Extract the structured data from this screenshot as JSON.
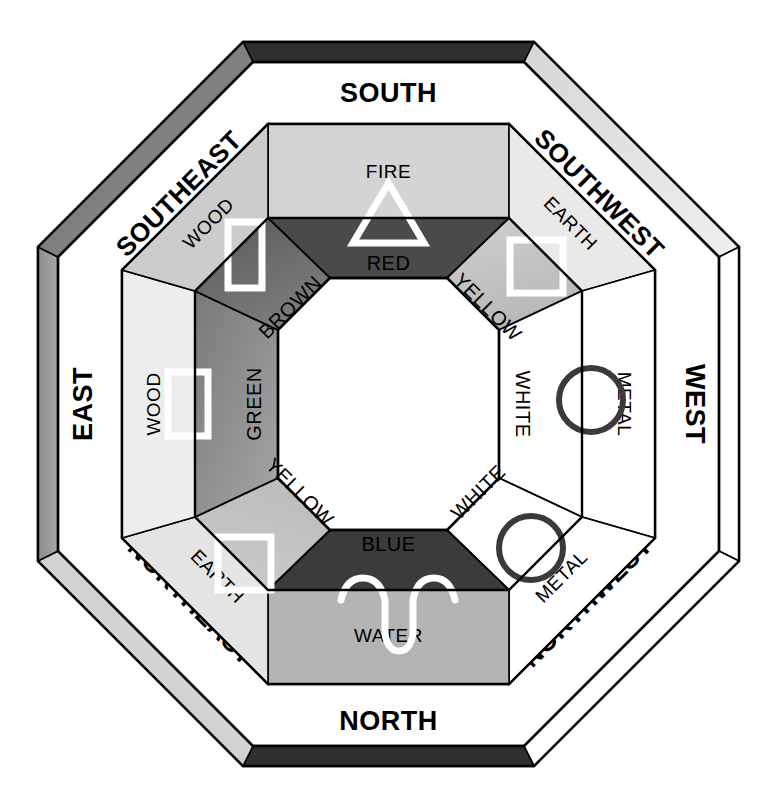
{
  "diagram": {
    "type": "bagua-octagon"
  },
  "colors": {
    "band_dark": "#2f2f2f",
    "band_mid": "#8a8a8a",
    "band_light": "#c9c9c9",
    "band_white": "#ffffff",
    "fire_fill": "#4a4a4a",
    "water_fill": "#3b3b3b",
    "wood_fill": "#6e6e6e",
    "earth_fill": "#bdbdbd",
    "metal_fill": "#ffffff",
    "ring_light": "#d9d9d9",
    "ring_pale": "#efefef",
    "center_fill": "#ffffff",
    "outline": "#000000",
    "symbol_stroke": "#ffffff",
    "metal_symbol_stroke": "#3a3a3a"
  },
  "directions": [
    {
      "label": "SOUTH",
      "position": "top",
      "band_shade": "band_dark"
    },
    {
      "label": "SOUTHWEST",
      "position": "top-right",
      "band_shade": "band_light"
    },
    {
      "label": "WEST",
      "position": "right",
      "band_shade": "band_white"
    },
    {
      "label": "NORTHWEST",
      "position": "bottom-right",
      "band_shade": "band_white"
    },
    {
      "label": "NORTH",
      "position": "bottom",
      "band_shade": "band_dark"
    },
    {
      "label": "NORTHEAST",
      "position": "bottom-left",
      "band_shade": "band_light"
    },
    {
      "label": "EAST",
      "position": "left",
      "band_shade": "band_mid"
    },
    {
      "label": "SOUTHEAST",
      "position": "top-left",
      "band_shade": "band_mid"
    }
  ],
  "elements": [
    {
      "label": "FIRE",
      "direction": "SOUTH",
      "color": "RED",
      "symbol": "triangle-icon"
    },
    {
      "label": "EARTH",
      "direction": "SOUTHWEST",
      "color": "YELLOW",
      "symbol": "square-icon"
    },
    {
      "label": "METAL",
      "direction": "WEST",
      "color": "WHITE",
      "symbol": "circle-icon"
    },
    {
      "label": "METAL",
      "direction": "NORTHWEST",
      "color": "WHITE",
      "symbol": "circle-icon"
    },
    {
      "label": "WATER",
      "direction": "NORTH",
      "color": "BLUE",
      "symbol": "wave-icon"
    },
    {
      "label": "EARTH",
      "direction": "NORTHEAST",
      "color": "YELLOW",
      "symbol": "square-icon"
    },
    {
      "label": "WOOD",
      "direction": "EAST",
      "color": "GREEN",
      "symbol": "rectangle-icon"
    },
    {
      "label": "WOOD",
      "direction": "SOUTHEAST",
      "color": "BROWN",
      "symbol": "rectangle-icon"
    }
  ],
  "element_labels": {
    "fire": "FIRE",
    "wood_se": "WOOD",
    "wood_e": "WOOD",
    "earth_sw": "EARTH",
    "earth_ne": "EARTH",
    "metal_w": "METAL",
    "metal_nw": "METAL",
    "water": "WATER"
  },
  "color_labels": {
    "red": "RED",
    "yellow_sw": "YELLOW",
    "white_w": "WHITE",
    "white_nw": "WHITE",
    "blue": "BLUE",
    "yellow_ne": "YELLOW",
    "green": "GREEN",
    "brown": "BROWN"
  },
  "direction_labels": {
    "south": "SOUTH",
    "southwest": "SOUTHWEST",
    "west": "WEST",
    "northwest": "NORTHWEST",
    "north": "NORTH",
    "northeast": "NORTHEAST",
    "east": "EAST",
    "southeast": "SOUTHEAST"
  },
  "symbols": {
    "fire": "triangle-icon",
    "water": "wave-icon",
    "wood_se": "rectangle-icon",
    "wood_e": "rectangle-icon",
    "earth_sw": "square-icon",
    "earth_ne": "square-icon",
    "metal_w": "circle-icon",
    "metal_nw": "circle-icon"
  }
}
